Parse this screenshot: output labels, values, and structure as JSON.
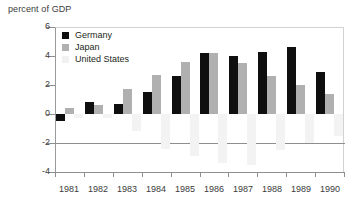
{
  "chart_data": {
    "type": "bar",
    "title": "",
    "ylabel": "percent of GDP",
    "xlabel": "",
    "categories": [
      "1981",
      "1982",
      "1983",
      "1984",
      "1985",
      "1986",
      "1987",
      "1988",
      "1989",
      "1990"
    ],
    "ylim": [
      -4,
      6
    ],
    "yticks": [
      6,
      4,
      2,
      0,
      -2,
      -4
    ],
    "ytick_labels": [
      "6",
      "4",
      "2",
      "0",
      "-2",
      "-4"
    ],
    "grid": false,
    "legend_position": "top-left",
    "series": [
      {
        "name": "Germany",
        "color": "#0f0f0f",
        "values": [
          -0.5,
          0.8,
          0.7,
          1.5,
          2.6,
          4.2,
          4.0,
          4.3,
          4.6,
          2.9
        ]
      },
      {
        "name": "Japan",
        "color": "#b0b0b0",
        "values": [
          0.4,
          0.6,
          1.7,
          2.7,
          3.6,
          4.2,
          3.5,
          2.6,
          2.0,
          1.4
        ]
      },
      {
        "name": "United States",
        "color": "#f3f3f3",
        "values": [
          -0.3,
          -0.3,
          -1.2,
          -2.4,
          -2.9,
          -3.4,
          -3.5,
          -2.5,
          -2.0,
          -1.5
        ]
      }
    ]
  },
  "axis": {
    "y_title": "percent of GDP"
  },
  "legend": {
    "items": [
      {
        "label": "Germany"
      },
      {
        "label": "Japan"
      },
      {
        "label": "United States"
      }
    ]
  }
}
